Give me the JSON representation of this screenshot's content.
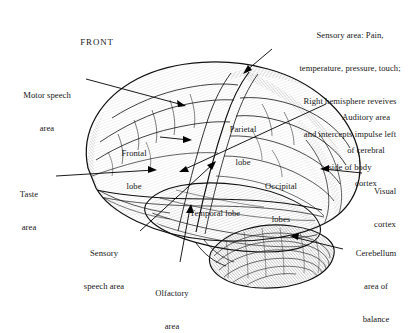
{
  "figure": {
    "type": "anatomical-diagram",
    "orientation_marker": "FRONT",
    "style": "pen-and-ink engraving, black line art on white background",
    "colors": {
      "ink": "#111111",
      "text": "#171717",
      "background": "#ffffff"
    }
  },
  "callouts": [
    {
      "name": "motor-speech-area",
      "lines": [
        "Motor speech",
        "area"
      ],
      "align": "center",
      "text_x": 47,
      "text_y": 68,
      "arrow": {
        "x1": 86,
        "y1": 79,
        "x2": 186,
        "y2": 106
      }
    },
    {
      "name": "sensory-area",
      "lines": [
        "Sensory area: Pain,",
        "temperature, pressure, touch;",
        "Right hemisphere reveives",
        "and intercepts impulse left",
        "side of body"
      ],
      "align": "center",
      "text_x": 350,
      "text_y": 8,
      "arrow": {
        "x1": 272,
        "y1": 49,
        "x2": 243,
        "y2": 74
      }
    },
    {
      "name": "auditory-area-of-cerebral-cortex",
      "lines": [
        "Auditory area",
        "of cerebral",
        "cortex"
      ],
      "align": "center",
      "text_x": 366,
      "text_y": 90,
      "arrow": {
        "x1": 326,
        "y1": 104,
        "x2": 179,
        "y2": 172
      }
    },
    {
      "name": "visual-cortex",
      "lines": [
        "Visual",
        "cortex"
      ],
      "align": "center",
      "text_x": 385,
      "text_y": 164,
      "arrow": {
        "x1": 362,
        "y1": 173,
        "x2": 320,
        "y2": 169
      }
    },
    {
      "name": "cerebellum-area-of-balance",
      "lines": [
        "Cerebellum",
        "area of",
        "balance"
      ],
      "align": "center",
      "text_x": 376,
      "text_y": 226,
      "arrow": {
        "x1": 343,
        "y1": 249,
        "x2": 290,
        "y2": 236
      }
    },
    {
      "name": "taste-area",
      "lines": [
        "Taste",
        "area"
      ],
      "align": "center",
      "text_x": 29,
      "text_y": 167,
      "arrow": {
        "x1": 56,
        "y1": 176,
        "x2": 157,
        "y2": 170
      }
    },
    {
      "name": "sensory-speech-area",
      "lines": [
        "Sensory",
        "speech area"
      ],
      "align": "center",
      "text_x": 104,
      "text_y": 226,
      "arrow": {
        "x1": 140,
        "y1": 231,
        "x2": 216,
        "y2": 161
      }
    },
    {
      "name": "olfactory-area",
      "lines": [
        "Olfactory",
        "area"
      ],
      "align": "center",
      "text_x": 172,
      "text_y": 266,
      "arrow": {
        "x1": 180,
        "y1": 262,
        "x2": 191,
        "y2": 204
      }
    }
  ],
  "region_labels": [
    {
      "name": "frontal-lobe",
      "lines": [
        "Frontal",
        "lobe"
      ],
      "x": 134,
      "y": 126,
      "arrow": {
        "x1": 160,
        "y1": 137,
        "x2": 192,
        "y2": 140
      }
    },
    {
      "name": "parietal-lobe",
      "lines": [
        "Parietal",
        "lobe"
      ],
      "x": 243,
      "y": 102
    },
    {
      "name": "occipital-lobes",
      "lines": [
        "Occipital",
        "lobes"
      ],
      "x": 281,
      "y": 159
    },
    {
      "name": "temporal-lobe",
      "lines": [
        "Temporal lobe"
      ],
      "x": 215,
      "y": 186
    }
  ],
  "orientation": {
    "label": "FRONT",
    "x": 97,
    "y": 37
  }
}
